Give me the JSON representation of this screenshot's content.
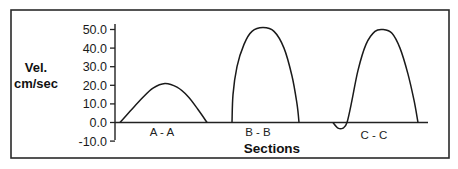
{
  "chart_data": {
    "type": "line",
    "title": "",
    "xlabel": "Sections",
    "ylabel": "Vel. cm/sec",
    "ylabel_lines": [
      "Vel.",
      "cm/sec"
    ],
    "ylim": [
      -10,
      50
    ],
    "yticks": [
      "50.0",
      "40.0",
      "30.0",
      "20.0",
      "10.0",
      "0.0",
      "-10.0"
    ],
    "ytick_values": [
      50,
      40,
      30,
      20,
      10,
      0,
      -10
    ],
    "grid": false,
    "legend": null,
    "categories": [
      "A - A",
      "B - B",
      "C - C"
    ],
    "series": [
      {
        "name": "A - A",
        "peak_velocity": 21,
        "min_velocity": 0,
        "points": [
          [
            120,
            0
          ],
          [
            130,
            6
          ],
          [
            142,
            13
          ],
          [
            153,
            18.5
          ],
          [
            165,
            21
          ],
          [
            177,
            19
          ],
          [
            188,
            14
          ],
          [
            198,
            7
          ],
          [
            207,
            0
          ]
        ]
      },
      {
        "name": "B - B",
        "peak_velocity": 51,
        "min_velocity": 0,
        "points": [
          [
            232,
            0
          ],
          [
            233,
            15
          ],
          [
            237,
            30
          ],
          [
            244,
            42
          ],
          [
            252,
            49
          ],
          [
            263,
            51
          ],
          [
            274,
            49
          ],
          [
            284,
            40
          ],
          [
            292,
            25
          ],
          [
            297,
            10
          ],
          [
            299,
            0
          ]
        ]
      },
      {
        "name": "C - C",
        "peak_velocity": 50,
        "min_velocity": -3,
        "points": [
          [
            333,
            0
          ],
          [
            338,
            -3
          ],
          [
            343,
            -3
          ],
          [
            347,
            0
          ],
          [
            352,
            12
          ],
          [
            358,
            28
          ],
          [
            366,
            42
          ],
          [
            375,
            49
          ],
          [
            383,
            50
          ],
          [
            392,
            48
          ],
          [
            400,
            40
          ],
          [
            408,
            26
          ],
          [
            414,
            12
          ],
          [
            418,
            0
          ]
        ]
      }
    ]
  }
}
